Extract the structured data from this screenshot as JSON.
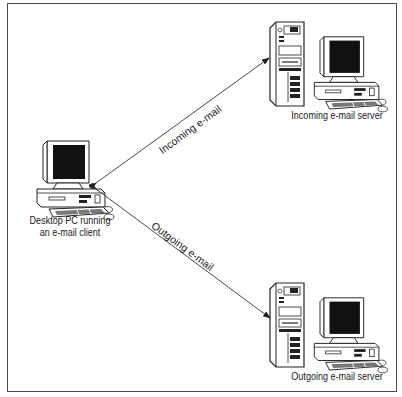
{
  "diagram": {
    "nodes": {
      "desktop": {
        "label_line1": "Desktop PC running",
        "label_line2": "an e-mail client"
      },
      "incoming_server": {
        "label": "Incoming e-mail server"
      },
      "outgoing_server": {
        "label": "Outgoing e-mail server"
      }
    },
    "edges": {
      "incoming": {
        "label": "Incoming e-mail",
        "from": "incoming_server",
        "to": "desktop"
      },
      "outgoing": {
        "label": "Outgoing e-mail",
        "from": "desktop",
        "to": "outgoing_server"
      }
    },
    "colors": {
      "line": "#333333",
      "frame": "#4a4a4a",
      "screen": "#111111",
      "fill": "#ffffff"
    }
  }
}
